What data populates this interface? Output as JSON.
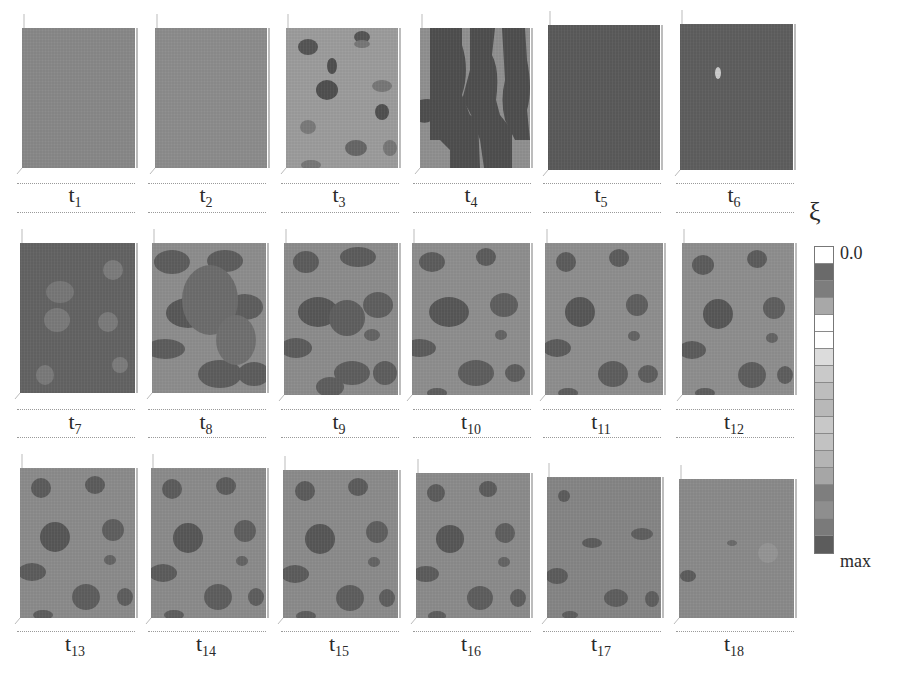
{
  "figure": {
    "colorbar": {
      "symbol": "ξ",
      "top_label": "0.0",
      "bottom_label": "max",
      "cells": [
        "#ffffff",
        "#6a6a6a",
        "#7d7d7d",
        "#a8a8a8",
        "#ffffff",
        "#ffffff",
        "#dcdcdc",
        "#c9c9c9",
        "#bdbdbd",
        "#b8b8b8",
        "#c8c8c8",
        "#c2c2c2",
        "#b4b4b4",
        "#a6a6a6",
        "#7e7e7e",
        "#8e8e8e",
        "#7a7a7a",
        "#5c5c5c"
      ]
    },
    "panels": [
      {
        "t": "t",
        "sub": "1",
        "x": 22,
        "y": 28,
        "w": 113,
        "h": 140,
        "bg": "#888888",
        "blobs": []
      },
      {
        "t": "t",
        "sub": "2",
        "x": 155,
        "y": 28,
        "w": 112,
        "h": 140,
        "bg": "#8c8c8c",
        "blobs": [],
        "edge": true
      },
      {
        "t": "t",
        "sub": "3",
        "x": 286,
        "y": 28,
        "w": 112,
        "h": 140,
        "bg": "#9c9c9c",
        "blobs": [
          [
            308,
            47,
            10,
            8,
            "#555"
          ],
          [
            362,
            37,
            8,
            6,
            "#555"
          ],
          [
            327,
            90,
            11,
            10,
            "#4f4f4f"
          ],
          [
            332,
            66,
            5,
            8,
            "#4f4f4f"
          ],
          [
            382,
            112,
            7,
            8,
            "#4f4f4f"
          ],
          [
            308,
            127,
            8,
            7,
            "#7a7a7a"
          ],
          [
            356,
            148,
            11,
            8,
            "#666"
          ],
          [
            390,
            148,
            7,
            8,
            "#777"
          ],
          [
            311,
            165,
            10,
            5,
            "#777"
          ],
          [
            382,
            86,
            10,
            6,
            "#777"
          ],
          [
            362,
            44,
            8,
            4,
            "#777"
          ]
        ]
      },
      {
        "t": "t",
        "sub": "4",
        "x": 420,
        "y": 28,
        "w": 110,
        "h": 140,
        "bg": "#909090",
        "blobs": []
      },
      {
        "t": "t",
        "sub": "5",
        "x": 548,
        "y": 25,
        "w": 112,
        "h": 145,
        "bg": "#5a5a5a",
        "blobs": []
      },
      {
        "t": "t",
        "sub": "6",
        "x": 680,
        "y": 24,
        "w": 113,
        "h": 146,
        "bg": "#5e5e5e",
        "blobs": [
          [
            718,
            73,
            3,
            6,
            "#cccccc"
          ]
        ]
      },
      {
        "t": "t",
        "sub": "7",
        "x": 20,
        "y": 243,
        "w": 115,
        "h": 150,
        "bg": "#636363",
        "blobs": [
          [
            60,
            292,
            14,
            11,
            "#777"
          ],
          [
            57,
            320,
            13,
            12,
            "#7a7a7a"
          ],
          [
            113,
            270,
            10,
            10,
            "#7c7c7c"
          ],
          [
            108,
            322,
            10,
            10,
            "#7b7b7b"
          ],
          [
            45,
            375,
            9,
            10,
            "#7a7a7a"
          ],
          [
            120,
            365,
            8,
            8,
            "#7c7c7c"
          ]
        ]
      },
      {
        "t": "t",
        "sub": "8",
        "x": 152,
        "y": 243,
        "w": 114,
        "h": 150,
        "bg": "#8d8d8d",
        "blobs": [
          [
            172,
            262,
            18,
            12,
            "#5d5d5d"
          ],
          [
            225,
            261,
            18,
            11,
            "#5d5d5d"
          ],
          [
            188,
            313,
            22,
            15,
            "#585858"
          ],
          [
            245,
            307,
            18,
            13,
            "#5e5e5e"
          ],
          [
            165,
            349,
            20,
            10,
            "#5d5d5d"
          ],
          [
            220,
            374,
            22,
            14,
            "#5d5d5d"
          ],
          [
            254,
            374,
            16,
            12,
            "#5d5d5d"
          ],
          [
            210,
            300,
            28,
            35,
            "#6c6c6c"
          ],
          [
            236,
            340,
            20,
            25,
            "#707070"
          ]
        ]
      },
      {
        "t": "t",
        "sub": "9",
        "x": 284,
        "y": 243,
        "w": 114,
        "h": 152,
        "bg": "#8c8c8c",
        "blobs": [
          [
            306,
            262,
            13,
            11,
            "#5c5c5c"
          ],
          [
            358,
            257,
            18,
            10,
            "#5c5c5c"
          ],
          [
            318,
            312,
            20,
            15,
            "#575757"
          ],
          [
            347,
            318,
            18,
            18,
            "#5f5f5f"
          ],
          [
            378,
            305,
            15,
            13,
            "#5f5f5f"
          ],
          [
            296,
            348,
            16,
            10,
            "#5c5c5c"
          ],
          [
            352,
            373,
            18,
            12,
            "#5e5e5e"
          ],
          [
            385,
            373,
            12,
            12,
            "#5e5e5e"
          ],
          [
            330,
            387,
            14,
            10,
            "#5e5e5e"
          ],
          [
            372,
            335,
            8,
            6,
            "#646464"
          ]
        ]
      },
      {
        "t": "t",
        "sub": "10",
        "x": 412,
        "y": 243,
        "w": 118,
        "h": 152,
        "bg": "#8e8e8e",
        "blobs": [
          [
            432,
            262,
            13,
            10,
            "#5c5c5c"
          ],
          [
            486,
            257,
            10,
            9,
            "#5c5c5c"
          ],
          [
            449,
            312,
            20,
            15,
            "#575757"
          ],
          [
            504,
            305,
            14,
            12,
            "#5f5f5f"
          ],
          [
            501,
            335,
            6,
            5,
            "#646464"
          ],
          [
            420,
            348,
            16,
            9,
            "#5c5c5c"
          ],
          [
            476,
            373,
            18,
            13,
            "#5e5e5e"
          ],
          [
            515,
            373,
            10,
            9,
            "#5e5e5e"
          ],
          [
            437,
            393,
            10,
            5,
            "#5e5e5e"
          ]
        ]
      },
      {
        "t": "t",
        "sub": "11",
        "x": 545,
        "y": 243,
        "w": 118,
        "h": 152,
        "bg": "#8e8e8e",
        "blobs": [
          [
            566,
            262,
            10,
            10,
            "#5c5c5c"
          ],
          [
            619,
            258,
            10,
            9,
            "#5c5c5c"
          ],
          [
            580,
            312,
            15,
            15,
            "#575757"
          ],
          [
            637,
            305,
            11,
            11,
            "#5f5f5f"
          ],
          [
            634,
            336,
            6,
            5,
            "#646464"
          ],
          [
            557,
            348,
            14,
            9,
            "#5c5c5c"
          ],
          [
            613,
            374,
            15,
            13,
            "#5e5e5e"
          ],
          [
            648,
            374,
            10,
            9,
            "#5e5e5e"
          ],
          [
            568,
            393,
            10,
            5,
            "#5e5e5e"
          ]
        ]
      },
      {
        "t": "t",
        "sub": "12",
        "x": 682,
        "y": 243,
        "w": 112,
        "h": 152,
        "bg": "#8e8e8e",
        "blobs": [
          [
            703,
            265,
            11,
            10,
            "#5c5c5c"
          ],
          [
            757,
            259,
            10,
            9,
            "#5c5c5c"
          ],
          [
            718,
            314,
            15,
            15,
            "#575757"
          ],
          [
            774,
            308,
            11,
            11,
            "#5f5f5f"
          ],
          [
            772,
            338,
            6,
            5,
            "#646464"
          ],
          [
            692,
            350,
            14,
            9,
            "#5c5c5c"
          ],
          [
            752,
            375,
            14,
            13,
            "#5e5e5e"
          ],
          [
            785,
            375,
            8,
            9,
            "#5e5e5e"
          ],
          [
            705,
            393,
            10,
            5,
            "#5e5e5e"
          ]
        ]
      },
      {
        "t": "t",
        "sub": "13",
        "x": 20,
        "y": 468,
        "w": 115,
        "h": 150,
        "bg": "#8b8b8b",
        "blobs": [
          [
            41,
            488,
            10,
            10,
            "#5c5c5c"
          ],
          [
            95,
            485,
            10,
            9,
            "#5c5c5c"
          ],
          [
            55,
            537,
            15,
            15,
            "#575757"
          ],
          [
            113,
            530,
            11,
            11,
            "#5f5f5f"
          ],
          [
            110,
            560,
            6,
            5,
            "#646464"
          ],
          [
            32,
            572,
            14,
            9,
            "#5c5c5c"
          ],
          [
            86,
            597,
            14,
            13,
            "#5e5e5e"
          ],
          [
            125,
            597,
            8,
            9,
            "#5e5e5e"
          ],
          [
            43,
            615,
            10,
            5,
            "#5e5e5e"
          ]
        ]
      },
      {
        "t": "t",
        "sub": "14",
        "x": 151,
        "y": 468,
        "w": 115,
        "h": 150,
        "bg": "#8b8b8b",
        "blobs": [
          [
            172,
            489,
            10,
            10,
            "#5c5c5c"
          ],
          [
            226,
            486,
            10,
            9,
            "#5c5c5c"
          ],
          [
            188,
            538,
            15,
            15,
            "#575757"
          ],
          [
            245,
            531,
            11,
            11,
            "#5f5f5f"
          ],
          [
            242,
            561,
            6,
            5,
            "#646464"
          ],
          [
            163,
            573,
            14,
            9,
            "#5c5c5c"
          ],
          [
            218,
            597,
            14,
            13,
            "#5e5e5e"
          ],
          [
            256,
            597,
            8,
            9,
            "#5e5e5e"
          ],
          [
            174,
            615,
            10,
            5,
            "#5e5e5e"
          ]
        ]
      },
      {
        "t": "t",
        "sub": "15",
        "x": 283,
        "y": 470,
        "w": 115,
        "h": 148,
        "bg": "#8b8b8b",
        "blobs": [
          [
            305,
            491,
            10,
            10,
            "#5c5c5c"
          ],
          [
            358,
            487,
            10,
            9,
            "#5c5c5c"
          ],
          [
            320,
            539,
            15,
            15,
            "#575757"
          ],
          [
            377,
            532,
            11,
            11,
            "#5f5f5f"
          ],
          [
            374,
            562,
            6,
            5,
            "#646464"
          ],
          [
            295,
            574,
            14,
            9,
            "#5c5c5c"
          ],
          [
            350,
            598,
            14,
            13,
            "#5e5e5e"
          ],
          [
            387,
            598,
            8,
            9,
            "#5e5e5e"
          ],
          [
            306,
            616,
            10,
            5,
            "#5e5e5e"
          ]
        ]
      },
      {
        "t": "t",
        "sub": "16",
        "x": 416,
        "y": 473,
        "w": 114,
        "h": 145,
        "bg": "#8b8b8b",
        "blobs": [
          [
            436,
            493,
            9,
            9,
            "#5c5c5c"
          ],
          [
            488,
            489,
            9,
            8,
            "#5c5c5c"
          ],
          [
            450,
            539,
            14,
            14,
            "#575757"
          ],
          [
            505,
            533,
            10,
            10,
            "#5f5f5f"
          ],
          [
            504,
            562,
            6,
            5,
            "#646464"
          ],
          [
            426,
            574,
            13,
            8,
            "#5c5c5c"
          ],
          [
            480,
            598,
            13,
            12,
            "#5e5e5e"
          ],
          [
            518,
            598,
            8,
            9,
            "#5e5e5e"
          ],
          [
            437,
            616,
            9,
            5,
            "#5e5e5e"
          ]
        ]
      },
      {
        "t": "t",
        "sub": "17",
        "x": 547,
        "y": 477,
        "w": 114,
        "h": 141,
        "bg": "#858585",
        "blobs": [
          [
            564,
            496,
            6,
            6,
            "#5c5c5c"
          ],
          [
            592,
            543,
            10,
            5,
            "#5c5c5c"
          ],
          [
            642,
            534,
            11,
            6,
            "#5f5f5f"
          ],
          [
            557,
            576,
            11,
            8,
            "#5c5c5c"
          ],
          [
            616,
            598,
            12,
            9,
            "#5e5e5e"
          ],
          [
            652,
            599,
            7,
            8,
            "#5e5e5e"
          ],
          [
            570,
            615,
            8,
            4,
            "#5e5e5e"
          ]
        ]
      },
      {
        "t": "t",
        "sub": "18",
        "x": 679,
        "y": 479,
        "w": 115,
        "h": 139,
        "bg": "#8a8a8a",
        "blobs": [
          [
            688,
            576,
            8,
            6,
            "#5c5c5c"
          ],
          [
            732,
            543,
            5,
            3,
            "#6a6a6a"
          ],
          [
            768,
            553,
            10,
            10,
            "#959595"
          ]
        ]
      }
    ],
    "band_shapes": {
      "t4": [
        "M430,28 L462,28 L462,45 Q470,70 462,95 L470,115 L478,120 L480,168 L450,168 L450,150 L440,140 L430,140 Z",
        "M470,28 L495,28 L492,55 Q500,70 496,100 L500,115 L512,130 L512,168 L484,168 L480,140 L475,125 Q470,110 462,100 L470,70 Z",
        "M502,28 L525,28 L527,60 Q533,90 527,110 L530,140 L515,140 L505,120 Q500,100 505,80 Z",
        "M420,100 Q440,95 437,115 Q430,125 420,122 Z"
      ]
    }
  }
}
